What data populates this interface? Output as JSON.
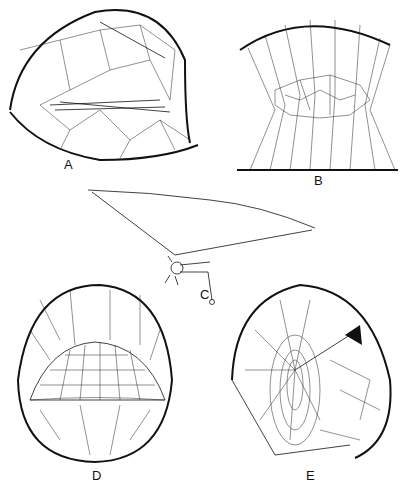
{
  "figure": {
    "panels": [
      {
        "id": "A",
        "label": "A",
        "subject": "sheet web with tangle above, spider beneath sheet"
      },
      {
        "id": "B",
        "label": "B",
        "subject": "tangle web between two horizontal supports"
      },
      {
        "id": "C",
        "label": "C",
        "subject": "spider with single triangular thread web"
      },
      {
        "id": "D",
        "label": "D",
        "subject": "dome web inside oval frame"
      },
      {
        "id": "E",
        "label": "E",
        "subject": "orb-like funnel web with retreat"
      }
    ]
  }
}
